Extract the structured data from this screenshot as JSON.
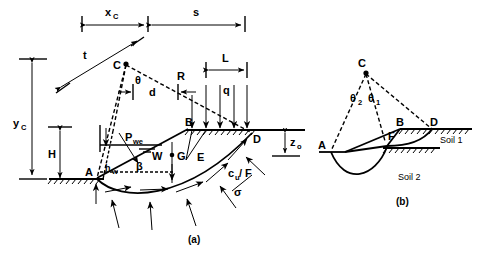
{
  "figure": {
    "caption_a": "(a)",
    "caption_b": "(b)",
    "panel_a": {
      "points": {
        "C": "C",
        "A": "A",
        "B": "B",
        "D": "D",
        "E": "E",
        "G": "G",
        "W": "W"
      },
      "dimensions": {
        "x_c": "x",
        "x_c_sub": "C",
        "s": "s",
        "t": "t",
        "d": "d",
        "R": "R",
        "L": "L",
        "y_c": "y",
        "y_c_sub": "C",
        "H": "H",
        "h_w": "h",
        "h_w_sub": "w",
        "z_o": "z",
        "z_o_sub": "o"
      },
      "angles": {
        "theta": "θ",
        "beta": "β"
      },
      "forces": {
        "q": "q",
        "P_we": "P",
        "P_we_sub": "we",
        "sigma": "σ",
        "cu_over_F": "c",
        "cu_sub": "u",
        "cu_rest": " / F"
      }
    },
    "panel_b": {
      "points": {
        "C": "C",
        "A": "A",
        "B": "B",
        "D": "D",
        "F": "F"
      },
      "angles": {
        "theta1": "θ",
        "theta1_sub": "1",
        "theta2": "θ",
        "theta2_sub": "2"
      },
      "layers": {
        "soil1": "Soil 1",
        "soil2": "Soil 2"
      }
    }
  },
  "colors": {
    "ink": "#000000",
    "background": "#ffffff"
  }
}
